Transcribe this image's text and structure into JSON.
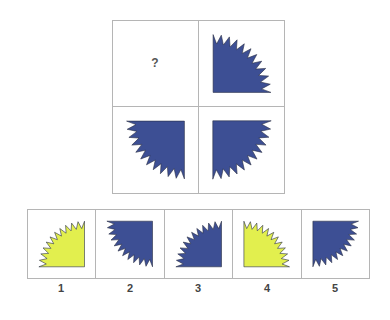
{
  "puzzle": {
    "colors": {
      "blue": "#3d4f94",
      "yellow": "#e2ef4e",
      "outline": "#2a2f45"
    },
    "grid": [
      {
        "position": "top-left",
        "content": "question",
        "text": "?"
      },
      {
        "position": "top-right",
        "content": "shape",
        "corner": "bottom-left",
        "color": "blue"
      },
      {
        "position": "bottom-left",
        "content": "shape",
        "corner": "top-right",
        "color": "blue"
      },
      {
        "position": "bottom-right",
        "content": "shape",
        "corner": "top-left",
        "color": "blue"
      }
    ],
    "options": [
      {
        "label": "1",
        "corner": "bottom-right",
        "color": "yellow"
      },
      {
        "label": "2",
        "corner": "top-right",
        "color": "blue"
      },
      {
        "label": "3",
        "corner": "bottom-right",
        "color": "blue"
      },
      {
        "label": "4",
        "corner": "bottom-left",
        "color": "yellow"
      },
      {
        "label": "5",
        "corner": "top-left",
        "color": "blue"
      }
    ]
  }
}
